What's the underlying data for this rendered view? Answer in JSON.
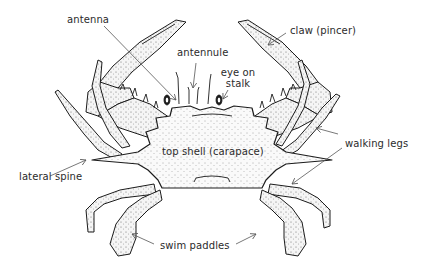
{
  "diagram": {
    "colors": {
      "background": "#ffffff",
      "line": "#1c1c1c",
      "label_text": "#2b2b2b",
      "pointer": "#555555"
    },
    "labels": {
      "antenna": "antenna",
      "antennule": "antennule",
      "eye_on_stalk_line1": "eye on",
      "eye_on_stalk_line2": "stalk",
      "claw": "claw (pincer)",
      "top_shell": "top shell (carapace)",
      "walking_legs": "walking legs",
      "lateral_spine": "lateral spine",
      "swim_paddles": "swim paddles"
    },
    "parts": [
      {
        "name": "antenna",
        "pointer_count": 1
      },
      {
        "name": "antennule",
        "pointer_count": 1
      },
      {
        "name": "eye on stalk",
        "pointer_count": 1
      },
      {
        "name": "claw (pincer)",
        "pointer_count": 1
      },
      {
        "name": "top shell (carapace)",
        "pointer_count": 0
      },
      {
        "name": "walking legs",
        "pointer_count": 2
      },
      {
        "name": "lateral spine",
        "pointer_count": 1
      },
      {
        "name": "swim paddles",
        "pointer_count": 2
      }
    ]
  }
}
